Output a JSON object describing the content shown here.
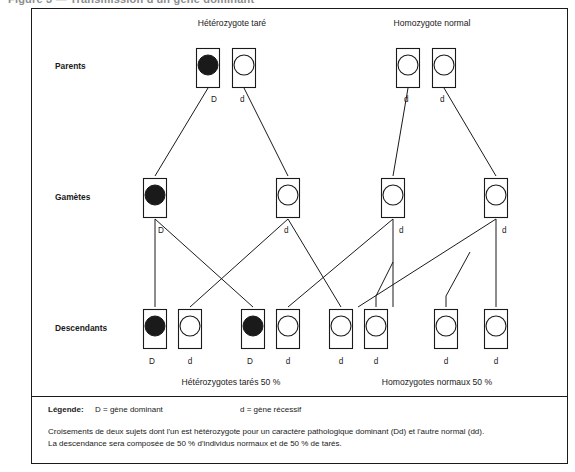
{
  "figure": {
    "cut_off_heading": "Figure 3 — Transmission d'un gène dominant",
    "row_labels": {
      "parents": "Parents",
      "gametes": "Gamètes",
      "offspring": "Descendants"
    },
    "parent_headings": {
      "left": "Hétérozygote taré",
      "right": "Homozygote normal"
    },
    "parents": [
      {
        "allele": "D",
        "type": "dominant"
      },
      {
        "allele": "d",
        "type": "recessive"
      },
      {
        "allele": "d",
        "type": "recessive"
      },
      {
        "allele": "d",
        "type": "recessive"
      }
    ],
    "gametes": [
      {
        "allele": "D",
        "type": "dominant"
      },
      {
        "allele": "d",
        "type": "recessive"
      },
      {
        "allele": "d",
        "type": "recessive"
      },
      {
        "allele": "d",
        "type": "recessive"
      }
    ],
    "offspring": [
      {
        "allele": "D",
        "type": "dominant"
      },
      {
        "allele": "d",
        "type": "recessive"
      },
      {
        "allele": "D",
        "type": "dominant"
      },
      {
        "allele": "d",
        "type": "recessive"
      },
      {
        "allele": "d",
        "type": "recessive"
      },
      {
        "allele": "d",
        "type": "recessive"
      },
      {
        "allele": "d",
        "type": "recessive"
      },
      {
        "allele": "d",
        "type": "recessive"
      }
    ],
    "results": {
      "left": "Hétérozygotes tarés  50 %",
      "right": "Homozygotes  normaux  50 %"
    },
    "legend": {
      "title": "Légende:",
      "dominant": "D = gène dominant",
      "recessive": "d = gène récessif"
    },
    "caption": {
      "line1": "Croisements de deux sujets dont l'un est hétérozygote pour un caractère pathologique dominant (Dd) et l'autre normal (dd).",
      "line2": "La descendance sera composée de 50 % d'individus normaux et de 50 % de tarés."
    },
    "colors": {
      "ink": "#1a1a1a",
      "paper": "#ffffff",
      "dominant_fill": "#1a1a1a",
      "recessive_fill": "#ffffff"
    }
  }
}
